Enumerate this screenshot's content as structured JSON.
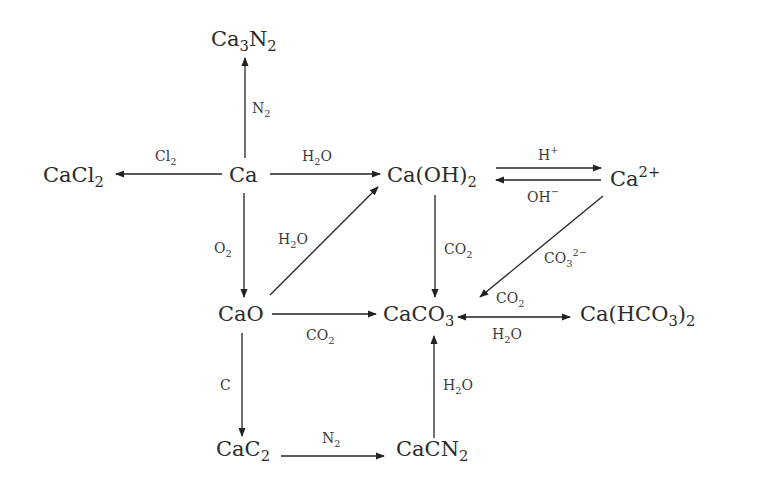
{
  "diagram": {
    "nodes": {
      "ca3n2": {
        "base": "Ca",
        "s1": "3",
        "mid": "N",
        "s2": "2"
      },
      "cacl2": {
        "base": "CaCl",
        "s1": "2"
      },
      "ca": {
        "base": "Ca"
      },
      "caoh2": {
        "base": "Ca(OH)",
        "s1": "2"
      },
      "ca2plus": {
        "base": "Ca",
        "sup": "2+"
      },
      "cao": {
        "base": "CaO"
      },
      "caco3": {
        "base": "CaCO",
        "s1": "3"
      },
      "cahco32": {
        "base": "Ca(HCO",
        "s1": "3",
        "mid": ")",
        "s2": "2"
      },
      "cac2": {
        "base": "CaC",
        "s1": "2"
      },
      "cacn2": {
        "base": "CaCN",
        "s1": "2"
      }
    },
    "edges": [
      {
        "from": "Ca",
        "to": "Ca3N2",
        "reagent": {
          "base": "N",
          "s1": "2"
        }
      },
      {
        "from": "Ca",
        "to": "CaCl2",
        "reagent": {
          "base": "Cl",
          "s1": "2"
        }
      },
      {
        "from": "Ca",
        "to": "Ca(OH)2",
        "reagent": {
          "base": "H",
          "s1": "2",
          "mid": "O"
        }
      },
      {
        "from": "Ca",
        "to": "CaO",
        "reagent": {
          "base": "O",
          "s1": "2"
        }
      },
      {
        "from": "CaO",
        "to": "Ca(OH)2",
        "reagent": {
          "base": "H",
          "s1": "2",
          "mid": "O"
        }
      },
      {
        "from": "Ca(OH)2",
        "to": "Ca2+",
        "reagent": {
          "base": "H",
          "sup": "+"
        }
      },
      {
        "from": "Ca2+",
        "to": "Ca(OH)2",
        "reagent": {
          "base": "OH",
          "sup": "−"
        }
      },
      {
        "from": "Ca(OH)2",
        "to": "CaCO3",
        "reagent": {
          "base": "CO",
          "s1": "2"
        }
      },
      {
        "from": "Ca2+",
        "to": "CaCO3",
        "reagent": {
          "base": "CO",
          "s1": "3",
          "sup": "2−"
        }
      },
      {
        "from": "CaO",
        "to": "CaCO3",
        "reagent": {
          "base": "CO",
          "s1": "2"
        }
      },
      {
        "from": "CaCO3",
        "to": "Ca(HCO3)2",
        "reagent": {
          "base": "CO",
          "s1": "2"
        }
      },
      {
        "from": "Ca(HCO3)2",
        "to": "CaCO3",
        "reagent": {
          "base": "H",
          "s1": "2",
          "mid": "O"
        }
      },
      {
        "from": "CaO",
        "to": "CaC2",
        "reagent": {
          "base": "C"
        }
      },
      {
        "from": "CaC2",
        "to": "CaCN2",
        "reagent": {
          "base": "N",
          "s1": "2"
        }
      },
      {
        "from": "CaCN2",
        "to": "CaCO3",
        "reagent": {
          "base": "H",
          "s1": "2",
          "mid": "O"
        }
      }
    ]
  }
}
